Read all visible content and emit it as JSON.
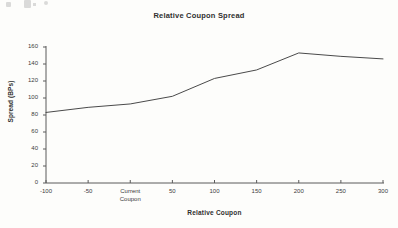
{
  "chart_data": {
    "type": "line",
    "title": "Relative Coupon Spread",
    "xlabel": "Relative Coupon",
    "ylabel": "Spread (BPs)",
    "grid": false,
    "legend": null,
    "xlim": [
      -100,
      300
    ],
    "ylim": [
      0,
      160
    ],
    "ytick_values": [
      0,
      20,
      40,
      60,
      80,
      100,
      120,
      140,
      160
    ],
    "ytick_labels": [
      "0",
      "20",
      "40",
      "60",
      "80",
      "100",
      "120",
      "140",
      "160"
    ],
    "xtick_values": [
      -100,
      -50,
      0,
      50,
      100,
      150,
      200,
      250,
      300
    ],
    "xtick_labels": [
      "-100",
      "-50",
      "Current Coupon",
      "50",
      "100",
      "150",
      "200",
      "250",
      "300"
    ],
    "x": [
      -100,
      -50,
      0,
      50,
      100,
      150,
      200,
      250,
      300
    ],
    "values": [
      83,
      89,
      93,
      102,
      123,
      133,
      153,
      149,
      146
    ],
    "series": [
      {
        "name": "Relative Coupon Spread",
        "x": [
          -100,
          -50,
          0,
          50,
          100,
          150,
          200,
          250,
          300
        ],
        "values": [
          83,
          89,
          93,
          102,
          123,
          133,
          153,
          149,
          146
        ]
      }
    ],
    "line_color": "#4a4a4a",
    "axis_color": "#5a5a5a",
    "background_color": "#fdfdfb"
  }
}
